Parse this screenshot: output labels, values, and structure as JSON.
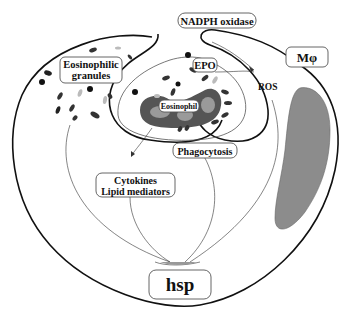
{
  "diagram": {
    "labels": {
      "nadph_oxidase": "NADPH oxidase",
      "eosinophilic_granules_line1": "Eosinophilic",
      "eosinophilic_granules_line2": "granules",
      "epo": "EPO",
      "ros": "ROS",
      "macrophage": "Mφ",
      "eosinophil": "Eosinophil",
      "phagocytosis": "Phagocytosis",
      "cytokines": "Cytokines",
      "lipid_mediators": "Lipid mediators",
      "hsp": "hsp"
    },
    "colors": {
      "outline": "#111111",
      "nucleus_dark": "#555555",
      "nucleus_light": "#9a9a9a",
      "vacuole_fill": "#8c8c8c",
      "granule_dark": "#222222",
      "granule_light": "#bbbbbb",
      "box_border": "#555555"
    }
  }
}
